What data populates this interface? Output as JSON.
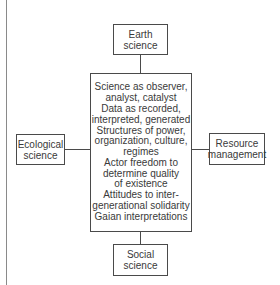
{
  "diagram": {
    "type": "hub-and-spoke",
    "center": {
      "lines": [
        "Science as observer,",
        "analyst, catalyst",
        "Data as recorded,",
        "interpreted, generated",
        "Structures of power,",
        "organization, culture,",
        "regimes",
        "Actor freedom to",
        "determine quality",
        "of existence",
        "Attitudes to inter-",
        "generational solidarity",
        "Gaian interpretations"
      ]
    },
    "nodes": {
      "top": {
        "lines": [
          "Earth",
          "science"
        ]
      },
      "left": {
        "lines": [
          "Ecological",
          "science"
        ]
      },
      "right": {
        "lines": [
          "Resource",
          "management"
        ]
      },
      "bottom": {
        "lines": [
          "Social",
          "science"
        ]
      }
    },
    "edges": [
      {
        "from": "top",
        "to": "center"
      },
      {
        "from": "left",
        "to": "center"
      },
      {
        "from": "right",
        "to": "center"
      },
      {
        "from": "bottom",
        "to": "center"
      }
    ],
    "colors": {
      "line": "#4a4a4a",
      "text": "#3a3a3a",
      "background": "#ffffff",
      "page_rule": "#8a8a8a"
    }
  }
}
